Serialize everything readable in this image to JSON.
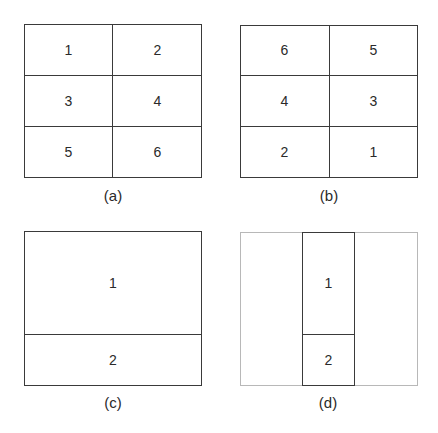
{
  "panels": [
    {
      "id": "a",
      "caption": "(a)",
      "cells": [
        "1",
        "2",
        "3",
        "4",
        "5",
        "6"
      ]
    },
    {
      "id": "b",
      "caption": "(b)",
      "cells": [
        "6",
        "5",
        "4",
        "3",
        "2",
        "1"
      ]
    },
    {
      "id": "c",
      "caption": "(c)",
      "cells": [
        "1",
        "2"
      ]
    },
    {
      "id": "d",
      "caption": "(d)",
      "cells": [
        "1",
        "2"
      ]
    }
  ]
}
